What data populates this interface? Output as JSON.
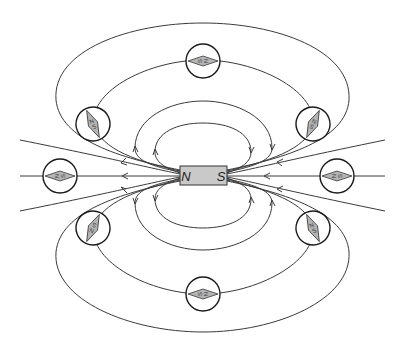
{
  "diagram": {
    "magnet": {
      "left_pole": "N",
      "right_pole": "S",
      "fill_color": "#c9c9c9"
    },
    "compasses": [
      {
        "id": "top",
        "north_label": "N",
        "south_label": "S",
        "orientation": "horizontal-north-right"
      },
      {
        "id": "upper-left",
        "north_label": "N",
        "south_label": "S",
        "orientation": "tilted"
      },
      {
        "id": "upper-right",
        "north_label": "N",
        "south_label": "S",
        "orientation": "tilted"
      },
      {
        "id": "left",
        "north_label": "N",
        "south_label": "S",
        "orientation": "horizontal-north-left"
      },
      {
        "id": "right",
        "north_label": "N",
        "south_label": "S",
        "orientation": "horizontal-north-left"
      },
      {
        "id": "lower-left",
        "north_label": "N",
        "south_label": "S",
        "orientation": "tilted"
      },
      {
        "id": "lower-right",
        "north_label": "N",
        "south_label": "S",
        "orientation": "tilted"
      },
      {
        "id": "bottom",
        "north_label": "N",
        "south_label": "S",
        "orientation": "horizontal-north-right"
      }
    ],
    "field_line_direction": "arrows point toward the N end of the magnet",
    "needle_color": "#b4b4b4",
    "line_color": "#3a3a3a"
  }
}
